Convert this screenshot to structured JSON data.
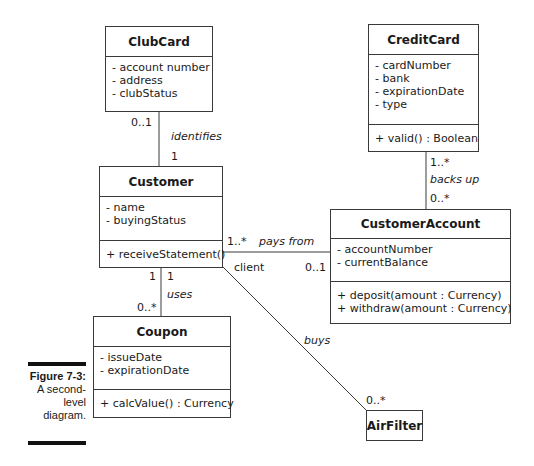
{
  "figure": {
    "label": "Figure 7-3:",
    "caption_lines": [
      "A second-",
      "level",
      "diagram."
    ]
  },
  "classes": {
    "clubcard": {
      "name": "ClubCard",
      "attributes": [
        "- account number",
        "- address",
        "- clubStatus"
      ]
    },
    "creditcard": {
      "name": "CreditCard",
      "attributes": [
        "- cardNumber",
        "- bank",
        "- expirationDate",
        "- type"
      ],
      "operations": [
        "+ valid() : Boolean"
      ]
    },
    "customer": {
      "name": "Customer",
      "attributes": [
        "- name",
        "- buyingStatus"
      ],
      "operations": [
        "+ receiveStatement()"
      ]
    },
    "customeraccount": {
      "name": "CustomerAccount",
      "attributes": [
        "- accountNumber",
        "- currentBalance"
      ],
      "operations": [
        "+ deposit(amount : Currency)",
        "+ withdraw(amount : Currency)"
      ]
    },
    "coupon": {
      "name": "Coupon",
      "attributes": [
        "- issueDate",
        "- expirationDate"
      ],
      "operations": [
        "+ calcValue() : Currency"
      ]
    },
    "airfilter": {
      "name": "AirFilter"
    }
  },
  "associations": {
    "identifies": {
      "name": "identifies",
      "mult_top": "0..1",
      "mult_bottom": "1"
    },
    "backs_up": {
      "name": "backs up",
      "mult_top": "1..*",
      "mult_bottom": "0..*"
    },
    "pays_from": {
      "name": "pays from",
      "mult_left": "1..*",
      "role_left": "client",
      "mult_right": "0..1"
    },
    "uses": {
      "name": "uses",
      "mult_left_top": "1",
      "mult_right_top": "1",
      "mult_bottom": "0..*"
    },
    "buys": {
      "name": "buys",
      "mult_end": "0..*"
    }
  }
}
